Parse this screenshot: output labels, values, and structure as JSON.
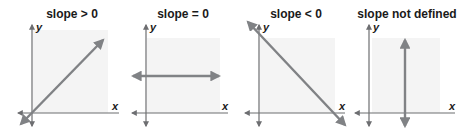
{
  "colors": {
    "axis": "#6d6e71",
    "line": "#808285",
    "shade": "#f4f4f4",
    "text": "#1a1a1a"
  },
  "panels": [
    {
      "title": "slope > 0",
      "x_label": "x",
      "y_label": "y",
      "line": "rising diagonal"
    },
    {
      "title": "slope = 0",
      "x_label": "x",
      "y_label": "y",
      "line": "horizontal"
    },
    {
      "title": "slope < 0",
      "x_label": "x",
      "y_label": "y",
      "line": "falling diagonal"
    },
    {
      "title": "slope not defined",
      "x_label": "x",
      "y_label": "y",
      "line": "vertical"
    }
  ]
}
